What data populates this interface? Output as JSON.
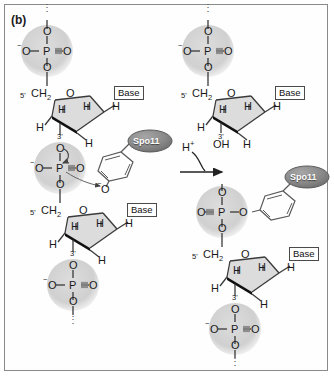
{
  "figure": {
    "panel_label": "(b)",
    "caption_reaction": "Spo11 transesterification / DNA strand cleavage",
    "background_color": "#ffffff",
    "border_color": "#8a8a8a",
    "shade_circle_color": "#d2d2d2",
    "spo11_fill_color": "#8c8c8c",
    "ring_fill_color": "#dcdcdc",
    "bond_color": "#3a3a3a"
  },
  "reaction": {
    "arrow_label": "H",
    "arrow_label_charge": "+",
    "direction": "left-to-right"
  },
  "left_structure": {
    "name": "DNA backbone with Spo11 tyrosine-phosphodiester intermediate",
    "top_dots": "⋮",
    "top_phosphate": {
      "o_top": "O",
      "o_left": "O",
      "o_left_charge": "−",
      "p": "P",
      "o_right": "O",
      "o_bottom": "O"
    },
    "top_sugar": {
      "five_prime": "5'",
      "ch2": "CH",
      "ch2_sub": "2",
      "ring_o": "O",
      "h_left": "H",
      "h_inner_left": "H",
      "h_inner_right": "H",
      "h_right": "H",
      "three_prime": "3'",
      "h_bottom": "H",
      "base_label": "Base"
    },
    "middle_phosphate": {
      "o_top": "O",
      "o_left": "O",
      "o_left_charge": "−",
      "p": "P",
      "o_right": "O",
      "o_bottom": "O",
      "leaving_o": "O",
      "leaving_o_charge": "−"
    },
    "spo11": {
      "label": "Spo11",
      "linker": "tyrosine CH2-phenol"
    },
    "bottom_sugar": {
      "five_prime": "5'",
      "ch2": "CH",
      "ch2_sub": "2",
      "ring_o": "O",
      "h_left": "H",
      "h_inner_left": "H",
      "h_inner_right": "H",
      "h_right": "H",
      "three_prime": "3'",
      "h_bottom": "H",
      "base_label": "Base"
    },
    "bottom_phosphate": {
      "o_top": "O",
      "o_left": "O",
      "o_left_charge": "−",
      "p": "P",
      "o_right": "O",
      "o_bottom": "O"
    },
    "bottom_dots": "⋮"
  },
  "right_structure": {
    "name": "Cleaved products: free 3'-OH DNA and Spo11 bound 5'-phosphotyrosyl DNA",
    "top_dots": "⋮",
    "top_phosphate": {
      "o_top": "O",
      "o_left": "O",
      "o_left_charge": "−",
      "p": "P",
      "o_right": "O",
      "o_bottom": "O"
    },
    "top_sugar": {
      "five_prime": "5'",
      "ch2": "CH",
      "ch2_sub": "2",
      "ring_o": "O",
      "h_left": "H",
      "h_inner_left": "H",
      "h_inner_right": "H",
      "h_right": "H",
      "three_prime": "3'",
      "hydroxyl": "OH",
      "h_bottom": "H",
      "base_label": "Base"
    },
    "spo11": {
      "label": "Spo11",
      "linker": "tyrosine CH2-phenol"
    },
    "middle_phosphate": {
      "o_top": "O",
      "o_left": "O",
      "p": "P",
      "o_right": "O",
      "o_bottom": "O"
    },
    "bottom_sugar": {
      "five_prime": "5'",
      "ch2": "CH",
      "ch2_sub": "2",
      "ring_o": "O",
      "h_left": "H",
      "h_inner_left": "H",
      "h_inner_right": "H",
      "h_right": "H",
      "three_prime": "3'",
      "h_bottom": "H",
      "base_label": "Base"
    },
    "bottom_phosphate": {
      "o_top": "O",
      "o_left": "O",
      "o_left_charge": "−",
      "p": "P",
      "o_right": "O",
      "o_bottom": "O"
    },
    "bottom_dots": "⋮"
  }
}
